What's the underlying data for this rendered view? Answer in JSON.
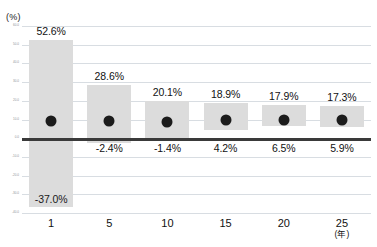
{
  "chart_data": {
    "type": "bar",
    "title": "",
    "subtitle": "",
    "xlabel": "(年)",
    "ylabel": "(%)",
    "grid": true,
    "legend_position": "none",
    "categories": [
      "1",
      "5",
      "10",
      "15",
      "20",
      "25"
    ],
    "ylim": [
      -40,
      60
    ],
    "ytick_step": 10,
    "yticks": [
      "60.0",
      "50.0",
      "40.0",
      "30.0",
      "20.0",
      "10.0",
      "0.0",
      "-10.0",
      "-20.0",
      "-30.0",
      "-40.0"
    ],
    "zero_line": 0,
    "series": [
      {
        "name": "最大",
        "values": [
          52.6,
          28.6,
          20.1,
          18.9,
          17.9,
          17.3
        ],
        "labels": [
          "52.6%",
          "28.6%",
          "20.1%",
          "18.9%",
          "17.9%",
          "17.3%"
        ]
      },
      {
        "name": "最小",
        "values": [
          -37.0,
          -2.4,
          -1.4,
          4.2,
          6.5,
          5.9
        ],
        "labels": [
          "-37.0%",
          "-2.4%",
          "-1.4%",
          "4.2%",
          "6.5%",
          "5.9%"
        ]
      },
      {
        "name": "平均",
        "values": [
          9.4,
          9.0,
          8.6,
          9.6,
          9.9,
          10.0
        ],
        "labels": [
          "",
          "",
          "",
          "",
          "",
          ""
        ]
      }
    ],
    "colors": {
      "bar": "#dcdcdc",
      "marker": "#1c1c1c",
      "zero_line": "#3a3a3a",
      "gridline": "#d8dde2",
      "text": "#111111",
      "background": "#ffffff"
    }
  }
}
